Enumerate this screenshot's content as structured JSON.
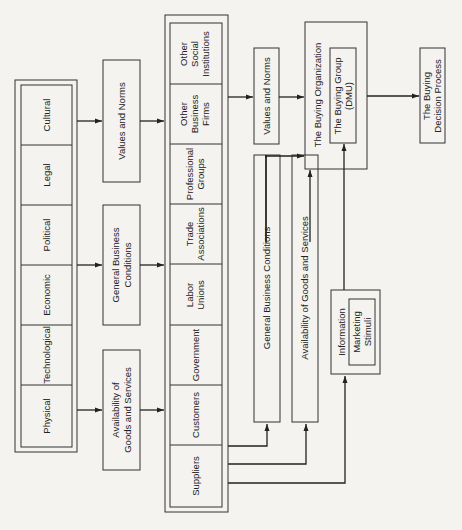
{
  "environment": {
    "title": "Environmental Influences",
    "factors": [
      "Cultural",
      "Legal",
      "Political",
      "Economic",
      "Technological",
      "Physical"
    ]
  },
  "environment_outputs": {
    "values_norms": "Values and Norms",
    "general_business_1": "General Business",
    "general_business_2": "Conditions",
    "availability_1": "Availability of",
    "availability_2": "Goods and Services"
  },
  "institutions": [
    [
      "Other",
      "Social",
      "Institutions"
    ],
    [
      "Other",
      "Business",
      "Firms"
    ],
    [
      "Professional",
      "Groups"
    ],
    [
      "Trade",
      "Associations"
    ],
    [
      "Labor",
      "Unions"
    ],
    [
      "Government"
    ],
    [
      "Customers"
    ],
    [
      "Suppliers"
    ]
  ],
  "institution_outputs": {
    "values_norms": "Values and Norms",
    "general_business": "General Business Conditions",
    "availability": "Availability of Goods and Services",
    "information": "Information",
    "marketing_1": "Marketing",
    "marketing_2": "Stimuli"
  },
  "buying": {
    "organization": "The Buying Organization",
    "group_1": "The Buying Group",
    "group_2": "(DMU)",
    "process_1": "The Buying",
    "process_2": "Decision Process"
  }
}
